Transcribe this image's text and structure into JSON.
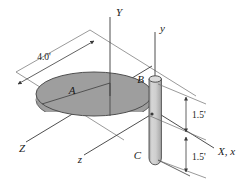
{
  "figure": {
    "background_color": "#ffffff",
    "line_color": "#3a3a3a",
    "disk_face_color": "#9a9a9a",
    "disk_edge_color": "#8a8a8a",
    "rod_color": "#c9c9c9",
    "rod_edge_color": "#4a4a4a"
  },
  "labels": {
    "point_a": "A",
    "point_b": "B",
    "point_c": "C",
    "axis_Y": "Y",
    "axis_y": "y",
    "axis_Z": "Z",
    "axis_z": "z",
    "axis_Xx": "X, x"
  },
  "dimensions": {
    "disk_diameter": "4.0'",
    "upper_segment": "1.5'",
    "lower_segment": "1.5'"
  }
}
